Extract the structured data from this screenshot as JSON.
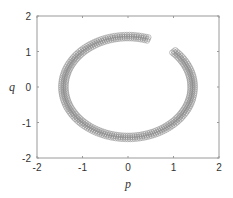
{
  "chart_data": {
    "type": "scatter",
    "title": "",
    "xlabel": "p",
    "ylabel": "q",
    "xlim": [
      -2,
      2
    ],
    "ylim": [
      -2,
      2
    ],
    "xticks": [
      -2,
      -1,
      0,
      1,
      2
    ],
    "yticks": [
      -2,
      -1,
      0,
      1,
      2
    ],
    "grid": false,
    "legend": null,
    "marker": "open-circle",
    "marker_color": "#8a8a8a",
    "series": [
      {
        "name": "trajectory",
        "start": [
          1.0,
          1.0
        ],
        "end": [
          0.45,
          1.4
        ],
        "radius": 1.42,
        "points": [
          [
            1.0,
            1.0
          ],
          [
            1.15,
            0.82
          ],
          [
            1.28,
            0.6
          ],
          [
            1.37,
            0.37
          ],
          [
            1.41,
            0.12
          ],
          [
            1.41,
            -0.12
          ],
          [
            1.37,
            -0.37
          ],
          [
            1.28,
            -0.6
          ],
          [
            1.15,
            -0.82
          ],
          [
            1.0,
            -1.0
          ],
          [
            0.82,
            -1.15
          ],
          [
            0.6,
            -1.28
          ],
          [
            0.37,
            -1.37
          ],
          [
            0.12,
            -1.41
          ],
          [
            -0.12,
            -1.41
          ],
          [
            -0.37,
            -1.37
          ],
          [
            -0.6,
            -1.28
          ],
          [
            -0.82,
            -1.15
          ],
          [
            -1.0,
            -1.0
          ],
          [
            -1.15,
            -0.82
          ],
          [
            -1.28,
            -0.6
          ],
          [
            -1.37,
            -0.37
          ],
          [
            -1.41,
            -0.12
          ],
          [
            -1.41,
            0.12
          ],
          [
            -1.37,
            0.37
          ],
          [
            -1.28,
            0.6
          ],
          [
            -1.15,
            0.82
          ],
          [
            -1.0,
            1.0
          ],
          [
            -0.82,
            1.15
          ],
          [
            -0.6,
            1.28
          ],
          [
            -0.37,
            1.37
          ],
          [
            -0.12,
            1.41
          ],
          [
            0.12,
            1.41
          ],
          [
            0.3,
            1.4
          ],
          [
            0.45,
            1.39
          ]
        ]
      }
    ]
  },
  "axes": {
    "x_label": "p",
    "y_label": "q",
    "x_tick_labels": [
      "-2",
      "-1",
      "0",
      "1",
      "2"
    ],
    "y_tick_labels": [
      "2",
      "1",
      "0",
      "-1",
      "-2"
    ]
  }
}
